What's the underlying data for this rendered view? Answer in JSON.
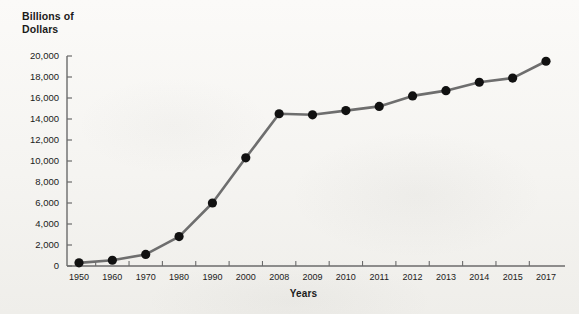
{
  "chart_data": {
    "type": "line",
    "title": "Billions of Dollars",
    "title_lines": [
      "Billions of",
      "Dollars"
    ],
    "xlabel": "Years",
    "ylabel": "Billions of Dollars",
    "categories": [
      "1950",
      "1960",
      "1970",
      "1980",
      "1990",
      "2000",
      "2008",
      "2009",
      "2010",
      "2011",
      "2012",
      "2013",
      "2014",
      "2015",
      "2017"
    ],
    "values": [
      300,
      550,
      1100,
      2800,
      6000,
      10300,
      14500,
      14400,
      14800,
      15200,
      16200,
      16700,
      17500,
      17900,
      19500
    ],
    "ylim": [
      0,
      20000
    ],
    "ytick_labels": [
      "0",
      "2,000",
      "4,000",
      "6,000",
      "8,000",
      "10,000",
      "12,000",
      "14,000",
      "16,000",
      "18,000",
      "20,000"
    ],
    "ytick_values": [
      0,
      2000,
      4000,
      6000,
      8000,
      10000,
      12000,
      14000,
      16000,
      18000,
      20000
    ],
    "grid": false,
    "legend": "none",
    "marker": "filled-circle",
    "line_color": "#6e6e6e",
    "marker_color": "#111111",
    "axis_color": "#6b6b6b",
    "background_color": "#f5f4f1"
  }
}
